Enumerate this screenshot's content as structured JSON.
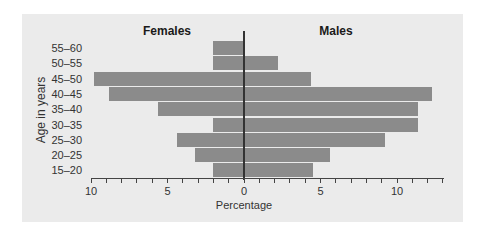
{
  "chart_data": {
    "type": "bar",
    "orientation": "horizontal",
    "subtype": "population-pyramid",
    "title": "",
    "xlabel": "Percentage",
    "ylabel": "Age in years",
    "left_title": "Females",
    "right_title": "Males",
    "categories": [
      "55–60",
      "50–55",
      "45–50",
      "40–45",
      "35–40",
      "30–35",
      "25–30",
      "20–25",
      "15–20"
    ],
    "series": [
      {
        "name": "Females",
        "side": "left",
        "values": [
          2.0,
          2.0,
          9.8,
          8.8,
          5.6,
          2.0,
          4.4,
          3.2,
          2.0
        ]
      },
      {
        "name": "Males",
        "side": "right",
        "values": [
          0.0,
          2.2,
          4.4,
          12.3,
          11.4,
          11.4,
          9.2,
          5.6,
          4.5
        ]
      }
    ],
    "x_ticks_left": [
      "10",
      "5",
      "0"
    ],
    "x_ticks_right": [
      "5",
      "10"
    ],
    "xlim_left": [
      10,
      0
    ],
    "xlim_right": [
      0,
      13
    ],
    "grid": false,
    "legend": "none",
    "bar_color": "#8b8b8b",
    "background_color": "#ebebeb"
  }
}
